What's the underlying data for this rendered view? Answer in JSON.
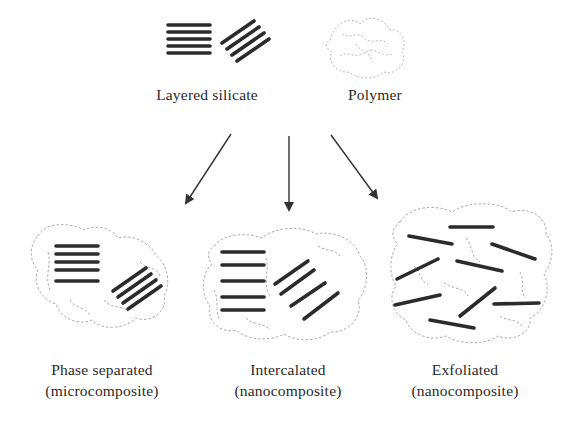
{
  "diagram": {
    "inputs": {
      "layered_silicate": {
        "label": "Layered silicate"
      },
      "polymer": {
        "label": "Polymer"
      }
    },
    "outcomes": [
      {
        "id": "phase-separated",
        "title": "Phase separated",
        "subtitle": "(microcomposite)"
      },
      {
        "id": "intercalated",
        "title": "Intercalated",
        "subtitle": "(nanocomposite)"
      },
      {
        "id": "exfoliated",
        "title": "Exfoliated",
        "subtitle": "(nanocomposite)"
      }
    ],
    "arrows": [
      {
        "from": "inputs",
        "to": "phase-separated"
      },
      {
        "from": "inputs",
        "to": "intercalated"
      },
      {
        "from": "inputs",
        "to": "exfoliated"
      }
    ],
    "colors": {
      "sheet": "#2b2b2b",
      "polymer": "#9a9a9a",
      "arrow": "#333333",
      "text": "#2a2a2a",
      "background": "#ffffff"
    }
  }
}
